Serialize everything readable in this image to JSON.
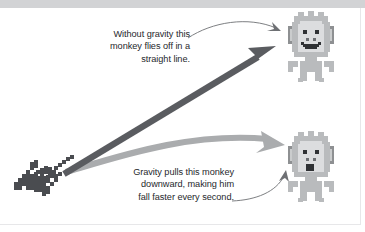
{
  "figure": {
    "background_color": "#ffffff",
    "band_color": "#d2d3d5",
    "width": 365,
    "height": 232
  },
  "captions": {
    "top": "Without gravity this\nmonkey flies off in a\nstraight line.",
    "bottom": "Gravity pulls this monkey\ndownward, making him\nfall faster every second.",
    "text_color": "#26282c"
  },
  "arrows": {
    "straight": {
      "label": "no-gravity trajectory",
      "color": "#5a5c60",
      "description": "thick dark straight arrow from launcher up to the right toward the upper monkey"
    },
    "curved": {
      "label": "gravity trajectory",
      "color": "#aaacae",
      "description": "thick light gray curved arrow arcing from launcher to the lower monkey"
    },
    "leader_top": {
      "label": "top caption leader line",
      "color": "#6e7074"
    },
    "leader_bottom": {
      "label": "bottom caption leader line",
      "color": "#6e7074"
    }
  },
  "sprites": {
    "launcher": {
      "label": "pixel-art pickaxe launcher",
      "color": "#4a4c50"
    },
    "monkey_top": {
      "label": "monkey flying in a straight line",
      "expression": "smiling",
      "body_color": "#b9bbbd",
      "face_color": "#dcdddf",
      "outline_color": "#8e9092"
    },
    "monkey_bottom": {
      "label": "monkey falling under gravity",
      "expression": "surprised",
      "body_color": "#b9bbbd",
      "face_color": "#dcdddf",
      "outline_color": "#8e9092"
    }
  }
}
